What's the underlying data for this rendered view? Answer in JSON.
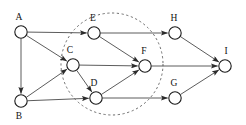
{
  "diagram": {
    "type": "directed-graph",
    "canvas": {
      "width": 246,
      "height": 125,
      "background": "#ffffff"
    },
    "style": {
      "node_fill": "#ffffff",
      "node_stroke": "#1a1a1a",
      "edge_color": "#4a4a4a",
      "cluster_stroke": "#6b6b6b",
      "label_color": "#111111"
    },
    "nodes": [
      {
        "id": "A",
        "label": "A",
        "cx": 21,
        "cy": 32,
        "r": 6.2,
        "label_x": 19,
        "label_y": 20,
        "in_cluster": false
      },
      {
        "id": "B",
        "label": "B",
        "cx": 21,
        "cy": 101,
        "r": 6.2,
        "label_x": 19,
        "label_y": 119,
        "in_cluster": false
      },
      {
        "id": "C",
        "label": "C",
        "cx": 73,
        "cy": 65,
        "r": 6.2,
        "label_x": 70,
        "label_y": 53,
        "in_cluster": true
      },
      {
        "id": "D",
        "label": "D",
        "cx": 96,
        "cy": 98,
        "r": 6.2,
        "label_x": 94,
        "label_y": 86,
        "in_cluster": true
      },
      {
        "id": "E",
        "label": "E",
        "cx": 94,
        "cy": 33,
        "r": 6.2,
        "label_x": 93,
        "label_y": 21,
        "in_cluster": true
      },
      {
        "id": "F",
        "label": "F",
        "cx": 145,
        "cy": 66,
        "r": 6.2,
        "label_x": 144,
        "label_y": 54,
        "in_cluster": true
      },
      {
        "id": "G",
        "label": "G",
        "cx": 175,
        "cy": 98,
        "r": 6.2,
        "label_x": 174,
        "label_y": 86,
        "in_cluster": false
      },
      {
        "id": "H",
        "label": "H",
        "cx": 175,
        "cy": 33,
        "r": 6.2,
        "label_x": 174,
        "label_y": 21,
        "in_cluster": false
      },
      {
        "id": "I",
        "label": "I",
        "cx": 225,
        "cy": 66,
        "r": 6.2,
        "label_x": 226,
        "label_y": 54,
        "in_cluster": false
      }
    ],
    "edges": [
      {
        "id": "A-E",
        "from": "A",
        "to": "E",
        "directed": true
      },
      {
        "id": "A-C",
        "from": "A",
        "to": "C",
        "directed": true
      },
      {
        "id": "A-B",
        "from": "A",
        "to": "B",
        "directed": true
      },
      {
        "id": "B-C",
        "from": "B",
        "to": "C",
        "directed": true
      },
      {
        "id": "B-D",
        "from": "B",
        "to": "D",
        "directed": true
      },
      {
        "id": "C-F",
        "from": "C",
        "to": "F",
        "directed": true
      },
      {
        "id": "C-D",
        "from": "C",
        "to": "D",
        "directed": true
      },
      {
        "id": "D-F",
        "from": "D",
        "to": "F",
        "directed": true
      },
      {
        "id": "D-G",
        "from": "D",
        "to": "G",
        "directed": true
      },
      {
        "id": "E-H",
        "from": "E",
        "to": "H",
        "directed": true
      },
      {
        "id": "E-F",
        "from": "E",
        "to": "F",
        "directed": true
      },
      {
        "id": "F-I",
        "from": "F",
        "to": "I",
        "directed": true
      },
      {
        "id": "G-I",
        "from": "G",
        "to": "I",
        "directed": true
      },
      {
        "id": "H-I",
        "from": "H",
        "to": "I",
        "directed": true
      }
    ],
    "cluster": {
      "id": "dashed-cluster",
      "cx": 112,
      "cy": 64,
      "r": 51,
      "members": [
        "C",
        "D",
        "E",
        "F"
      ],
      "stroke_style": "dashed"
    }
  }
}
